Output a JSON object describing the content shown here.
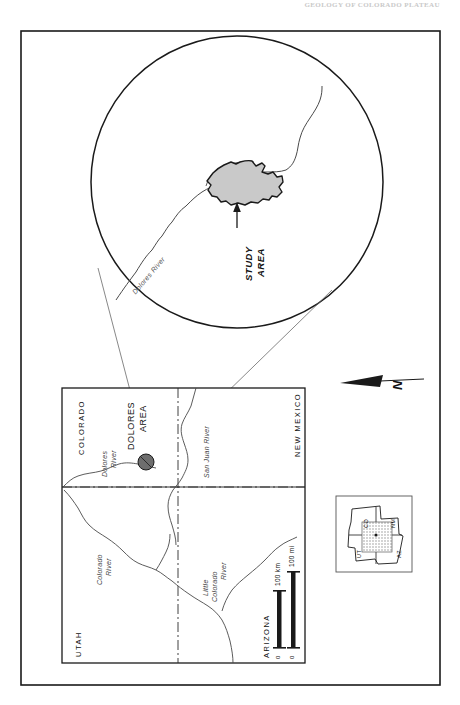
{
  "figure": {
    "header_note": "GEOLOGY OF COLORADO PLATEAU",
    "type": "location-map"
  },
  "inset_circle": {
    "name": "magnified-detail-circle",
    "study_area_label_line1": "STUDY",
    "study_area_label_line2": "AREA",
    "river_label": "Dolores River",
    "shade_color": "#c9c9c9"
  },
  "main_map": {
    "states": [
      {
        "key": "utah",
        "label": "UTAH"
      },
      {
        "key": "colorado",
        "label": "COLORADO"
      },
      {
        "key": "arizona",
        "label": "ARIZONA"
      },
      {
        "key": "new_mexico",
        "label": "NEW MEXICO"
      }
    ],
    "rivers": [
      {
        "key": "dolores",
        "line1": "Dolores",
        "line2": "River"
      },
      {
        "key": "san_juan",
        "label": "San Juan River"
      },
      {
        "key": "colorado",
        "line1": "Colorado",
        "line2": "River"
      },
      {
        "key": "little_colorado",
        "line1": "Little",
        "line2": "Colorado",
        "line3": "River"
      }
    ],
    "area_marker": {
      "label_line1": "DOLORES",
      "label_line2": "AREA",
      "marker_fill": "#6e6e6e"
    },
    "scale_bar": {
      "zero_km": "0",
      "zero_mi": "0",
      "km_label": "100 km",
      "mi_label": "100 mi"
    },
    "north_arrow": {
      "label": "N"
    }
  },
  "locator_inset": {
    "name": "four-corners-locator",
    "states": [
      {
        "key": "ut",
        "label": "UT"
      },
      {
        "key": "co",
        "label": "CO"
      },
      {
        "key": "az",
        "label": "AZ"
      },
      {
        "key": "nm",
        "label": "NM"
      }
    ],
    "hatch_color": "#8a8a8a"
  },
  "colors": {
    "ink": "#1a1a1a",
    "study_area_fill": "#c9c9c9",
    "marker_fill": "#6e6e6e",
    "paper": "#ffffff"
  }
}
